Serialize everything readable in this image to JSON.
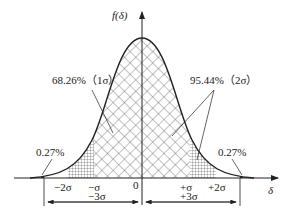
{
  "diagram": {
    "type": "normal-distribution",
    "y_axis_label": "f(δ)",
    "x_axis_label": "δ",
    "annotations": {
      "one_sigma": "68.26%（1σ）",
      "two_sigma": "95.44%（2σ）",
      "left_tail": "0.27%",
      "right_tail": "0.27%"
    },
    "x_ticks": {
      "minus_two_sigma": "−2σ",
      "minus_sigma": "−σ",
      "zero": "0",
      "plus_sigma": "+σ",
      "plus_two_sigma": "+2σ"
    },
    "dimensions": {
      "left": "−3σ",
      "right": "+3σ"
    },
    "colors": {
      "line": "#222222",
      "hatch": "#333333",
      "background": "#ffffff"
    }
  }
}
